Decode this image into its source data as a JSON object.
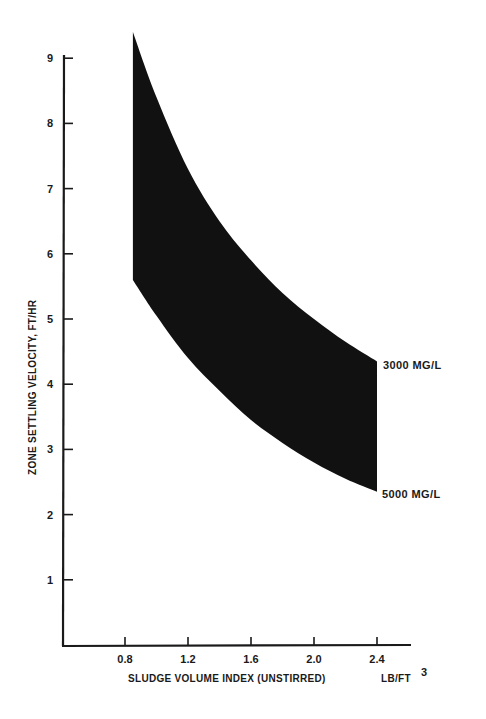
{
  "chart_data": {
    "type": "area",
    "title": "",
    "xlabel": "SLUDGE VOLUME INDEX (UNSTIRRED)",
    "xlabel_units": "LB/FT",
    "xlabel_units_sup": "3",
    "ylabel": "ZONE SETTLING VELOCITY, FT/HR",
    "xlim": [
      0.4,
      2.8
    ],
    "ylim": [
      0,
      9.5
    ],
    "x_ticks": [
      "0.8",
      "1.2",
      "1.6",
      "2.0",
      "2.4"
    ],
    "y_ticks": [
      "1",
      "2",
      "3",
      "4",
      "5",
      "6",
      "7",
      "8",
      "9"
    ],
    "grid": false,
    "legend": "inline labels at right end of band",
    "series": [
      {
        "name": "3000 MG/L",
        "x": [
          0.85,
          1.0,
          1.2,
          1.4,
          1.6,
          1.8,
          2.0,
          2.2,
          2.4
        ],
        "values": [
          9.4,
          8.4,
          7.3,
          6.5,
          5.9,
          5.4,
          5.0,
          4.65,
          4.35
        ]
      },
      {
        "name": "5000 MG/L",
        "x": [
          0.85,
          1.0,
          1.2,
          1.4,
          1.6,
          1.8,
          2.0,
          2.2,
          2.4
        ],
        "values": [
          5.6,
          5.05,
          4.4,
          3.9,
          3.45,
          3.1,
          2.8,
          2.55,
          2.35
        ]
      }
    ],
    "fill_between": true,
    "fill_color": "#111111"
  },
  "labels": {
    "series_top": "3000 MG/L",
    "series_bottom": "5000 MG/L",
    "xlabel": "SLUDGE VOLUME INDEX (UNSTIRRED)",
    "xunits": "LB/FT",
    "xunits_sup": "3",
    "ylabel": "ZONE SETTLING VELOCITY, FT/HR",
    "x_ticks": [
      "0.8",
      "1.2",
      "1.6",
      "2.0",
      "2.4"
    ],
    "y_ticks": [
      "1",
      "2",
      "3",
      "4",
      "5",
      "6",
      "7",
      "8",
      "9"
    ]
  }
}
